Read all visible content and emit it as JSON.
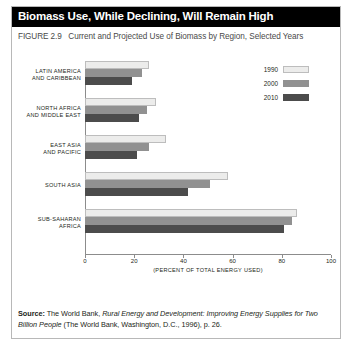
{
  "figure": {
    "title": "Biomass Use, While Declining, Will Remain High",
    "figure_number": "FIGURE 2.9",
    "subtitle": "Current and Projected Use of Biomass by Region, Selected Years",
    "source_label": "Source:",
    "source_text_part1": " The World Bank, ",
    "source_italic1": "Rural Energy and Development: Improving Energy Supplies for Two Billion People",
    "source_text_part2": " (The World Bank, Washington, D.C., 1996), p. 26."
  },
  "chart_data": {
    "type": "bar",
    "orientation": "horizontal",
    "title": "Biomass Use, While Declining, Will Remain High",
    "subtitle": "FIGURE 2.9  Current and Projected Use of Biomass by Region, Selected Years",
    "xlabel": "(PERCENT OF TOTAL ENERGY USED)",
    "ylabel": "",
    "xlim": [
      0,
      100
    ],
    "xticks": [
      0,
      20,
      40,
      60,
      80,
      100
    ],
    "xticklabels": [
      "0",
      "20",
      "40",
      "60",
      "80",
      "100"
    ],
    "grid": false,
    "legend_position": "center-right",
    "categories": [
      "LATIN AMERICA AND CARIBBEAN",
      "NORTH AFRICA AND MIDDLE EAST",
      "EAST ASIA AND PACIFIC",
      "SOUTH ASIA",
      "SUB-SAHARAN AFRICA"
    ],
    "category_lines": [
      [
        "LATIN AMERICA",
        "AND CARIBBEAN"
      ],
      [
        "NORTH AFRICA",
        "AND MIDDLE EAST"
      ],
      [
        "EAST ASIA",
        "AND PACIFIC"
      ],
      [
        "SOUTH ASIA"
      ],
      [
        "SUB-SAHARAN",
        "AFRICA"
      ]
    ],
    "series": [
      {
        "name": "1990",
        "color": "#ececeb",
        "values": [
          26,
          29,
          33,
          58,
          86
        ]
      },
      {
        "name": "2000",
        "color": "#919191",
        "values": [
          23,
          25,
          26,
          51,
          84
        ]
      },
      {
        "name": "2010",
        "color": "#4c4c4c",
        "values": [
          19,
          22,
          21,
          42,
          81
        ]
      }
    ]
  },
  "legend": {
    "items": [
      {
        "label": "1990"
      },
      {
        "label": "2000"
      },
      {
        "label": "2010"
      }
    ]
  }
}
